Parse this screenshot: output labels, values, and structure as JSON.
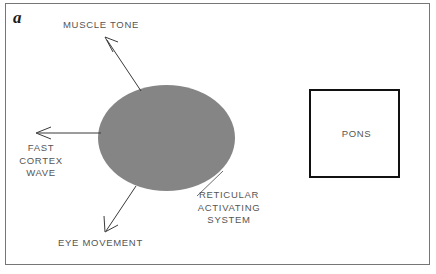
{
  "figure": {
    "panel_letter": "a"
  },
  "diagram": {
    "center_structure": {
      "name": "reticular-activating-system",
      "caption_lines": [
        "RETICULAR",
        "ACTIVATING",
        "SYSTEM"
      ],
      "caption_text": "RETICULAR\nACTIVATING\nSYSTEM",
      "fill": "#cfcfcf",
      "stipple_color": "#787878"
    },
    "outputs": [
      {
        "id": "muscle-tone",
        "label": "MUSCLE TONE",
        "direction": "up-left",
        "arrow": true
      },
      {
        "id": "fast-cortex-wave",
        "label": "FAST\nCORTEX\nWAVE",
        "label_lines": [
          "FAST",
          "CORTEX",
          "WAVE"
        ],
        "direction": "left",
        "arrow": true
      },
      {
        "id": "eye-movement",
        "label": "EYE MOVEMENT",
        "direction": "down-left",
        "arrow": true
      }
    ],
    "box": {
      "id": "pons",
      "label": "PONS",
      "border_color": "#111111"
    },
    "frame": {
      "border_color": "#767676"
    },
    "text_color": "#555555"
  }
}
